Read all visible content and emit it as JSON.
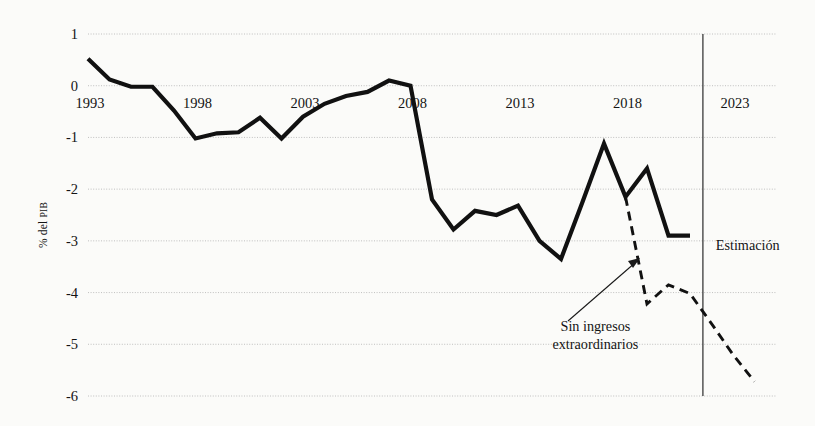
{
  "chart_data": {
    "type": "line",
    "title": "",
    "xlabel": "",
    "ylabel": "% del PIB",
    "ylabel_main": "% del ",
    "ylabel_smallcaps": "PIB",
    "xlim": [
      1993,
      2025
    ],
    "ylim": [
      -6,
      1
    ],
    "grid": true,
    "legend_position": "none",
    "y_ticks": [
      1,
      0,
      -1,
      -2,
      -3,
      -4,
      -5,
      -6
    ],
    "y_tick_labels": [
      "1",
      "0",
      "-1",
      "-2",
      "-3",
      "-4",
      "-5",
      "-6"
    ],
    "x_ticks": [
      1993,
      1998,
      2003,
      2008,
      2013,
      2018,
      2023
    ],
    "x_tick_labels": [
      "1993",
      "1998",
      "2003",
      "2008",
      "2013",
      "2018",
      "2023"
    ],
    "series": [
      {
        "name": "Saldo observado",
        "style": "solid",
        "color": "#111111",
        "x": [
          1993,
          1994,
          1995,
          1996,
          1997,
          1998,
          1999,
          2000,
          2001,
          2002,
          2003,
          2004,
          2005,
          2006,
          2007,
          2008,
          2009,
          2010,
          2011,
          2012,
          2013,
          2014,
          2015,
          2016,
          2017,
          2018,
          2019,
          2020,
          2021
        ],
        "values": [
          0.52,
          0.12,
          -0.02,
          -0.02,
          -0.48,
          -1.02,
          -0.92,
          -0.9,
          -0.62,
          -1.02,
          -0.6,
          -0.35,
          -0.2,
          -0.12,
          0.1,
          0.0,
          -2.2,
          -2.78,
          -2.42,
          -2.5,
          -2.32,
          -3.0,
          -3.35,
          -2.25,
          -1.12,
          -2.15,
          -1.6,
          -2.9,
          -2.9
        ]
      },
      {
        "name": "Sin ingresos extraordinarios",
        "style": "dashed",
        "color": "#111111",
        "x": [
          2018,
          2019,
          2020,
          2021,
          2022,
          2023,
          2024
        ],
        "values": [
          -2.15,
          -4.22,
          -3.85,
          -4.02,
          -4.6,
          -5.2,
          -5.72
        ]
      }
    ],
    "annotations": [
      {
        "name": "estimacion-label",
        "text": "Estimación",
        "x": 2022.2,
        "y": -3.18
      },
      {
        "name": "sin-ingresos-label",
        "line1": "Sin ingresos",
        "line2": "extraordinarios",
        "x": 2016.6,
        "y": -4.75
      }
    ],
    "vertical_divider": {
      "name": "estimacion-divider",
      "x": 2021.6,
      "label": "Estimación"
    }
  },
  "axis": {
    "y_title_prefix": "% del ",
    "y_title_suffix": "PIB"
  }
}
